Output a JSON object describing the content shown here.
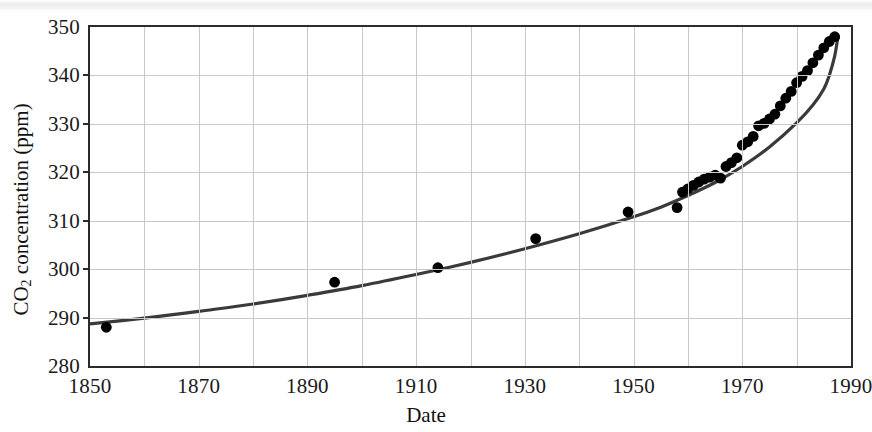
{
  "chart_data": {
    "type": "scatter",
    "title": "",
    "xlabel": "Date",
    "ylabel": "CO2 concentration (ppm)",
    "ylabel_parts": {
      "pre": "CO",
      "sub": "2",
      "post": " concentration (ppm)"
    },
    "xlim": [
      1850,
      1990
    ],
    "ylim": [
      280,
      350
    ],
    "xticks": [
      1850,
      1870,
      1890,
      1910,
      1930,
      1950,
      1970,
      1990
    ],
    "yticks": [
      280,
      290,
      300,
      310,
      320,
      330,
      340,
      350
    ],
    "xtick_labels": [
      "1850",
      "1870",
      "1890",
      "1910",
      "1930",
      "1950",
      "1970",
      "1990"
    ],
    "ytick_labels": [
      "280",
      "290",
      "300",
      "310",
      "320",
      "330",
      "340",
      "350"
    ],
    "grid": true,
    "grid_color": "#c9c9cd",
    "legend": null,
    "marker_color": "#000000",
    "line_color": "#3a3a3a",
    "series": [
      {
        "name": "Measured CO2 concentration",
        "type": "scatter",
        "marker": "filled-circle",
        "points": [
          [
            1853,
            288.0
          ],
          [
            1895,
            297.3
          ],
          [
            1914,
            300.3
          ],
          [
            1932,
            306.3
          ],
          [
            1949,
            311.8
          ],
          [
            1958,
            312.7
          ],
          [
            1959,
            315.9
          ],
          [
            1960,
            316.6
          ],
          [
            1961,
            317.3
          ],
          [
            1962,
            318.0
          ],
          [
            1963,
            318.6
          ],
          [
            1964,
            319.0
          ],
          [
            1965,
            319.4
          ],
          [
            1966,
            318.8
          ],
          [
            1967,
            321.2
          ],
          [
            1968,
            322.0
          ],
          [
            1969,
            323.0
          ],
          [
            1970,
            325.6
          ],
          [
            1971,
            326.3
          ],
          [
            1972,
            327.4
          ],
          [
            1973,
            329.6
          ],
          [
            1974,
            330.1
          ],
          [
            1975,
            331.0
          ],
          [
            1976,
            332.0
          ],
          [
            1977,
            333.7
          ],
          [
            1978,
            335.3
          ],
          [
            1979,
            336.7
          ],
          [
            1980,
            338.5
          ],
          [
            1981,
            339.8
          ],
          [
            1982,
            341.0
          ],
          [
            1983,
            342.6
          ],
          [
            1984,
            344.2
          ],
          [
            1985,
            345.7
          ],
          [
            1986,
            347.0
          ],
          [
            1987,
            348.0
          ]
        ]
      },
      {
        "name": "Fitted trend curve",
        "type": "line",
        "points": [
          [
            1850,
            288.7
          ],
          [
            1860,
            289.9
          ],
          [
            1870,
            291.3
          ],
          [
            1880,
            292.8
          ],
          [
            1890,
            294.6
          ],
          [
            1900,
            296.6
          ],
          [
            1910,
            298.9
          ],
          [
            1920,
            301.4
          ],
          [
            1930,
            304.2
          ],
          [
            1940,
            307.3
          ],
          [
            1950,
            310.8
          ],
          [
            1955,
            312.8
          ],
          [
            1960,
            315.2
          ],
          [
            1965,
            317.9
          ],
          [
            1970,
            321.2
          ],
          [
            1975,
            325.2
          ],
          [
            1980,
            330.2
          ],
          [
            1983,
            333.9
          ],
          [
            1985,
            337.2
          ],
          [
            1986,
            340.0
          ],
          [
            1987,
            344.0
          ],
          [
            1987.6,
            348.0
          ]
        ]
      }
    ]
  }
}
